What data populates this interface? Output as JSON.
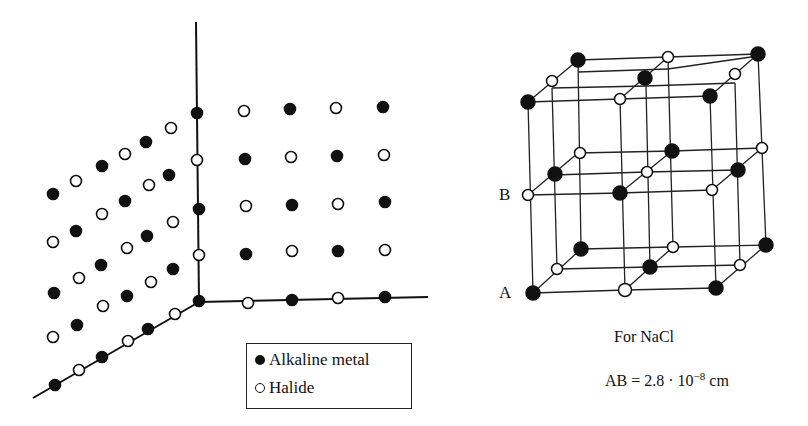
{
  "legend": {
    "items": [
      {
        "label": "Alkaline metal",
        "symbol": "filled-circle"
      },
      {
        "label": "Halide",
        "symbol": "hollow-circle"
      }
    ]
  },
  "cube": {
    "point_labels": {
      "a": "A",
      "b": "B"
    }
  },
  "caption": {
    "title": "For NaCl",
    "formula_prefix": "AB = 2.8 · 10",
    "formula_exponent": "−8",
    "formula_unit": " cm"
  },
  "colors": {
    "ink": "#111111",
    "background": "#ffffff"
  }
}
